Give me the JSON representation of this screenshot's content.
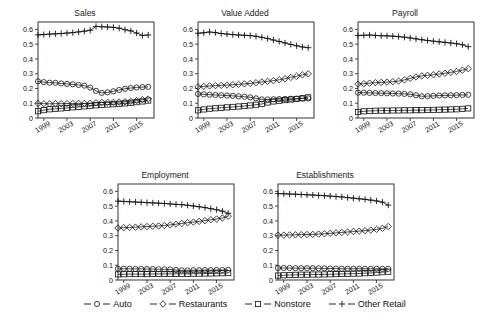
{
  "figure": {
    "width": 490,
    "height": 322,
    "background": "#ffffff",
    "axis_color": "#333333",
    "series_color": "#111111"
  },
  "legend": {
    "position": "bottom-center",
    "items": [
      {
        "label": "Auto",
        "marker": "circle-icon"
      },
      {
        "label": "Restaurants",
        "marker": "diamond-icon"
      },
      {
        "label": "Nonstore",
        "marker": "square-icon"
      },
      {
        "label": "Other Retail",
        "marker": "plus-icon"
      }
    ]
  },
  "chart_data": [
    {
      "type": "line",
      "title": "Sales",
      "xlabel": "",
      "ylabel": "",
      "xlim": [
        1998,
        2018
      ],
      "ylim": [
        0,
        0.65
      ],
      "yticks": [
        0,
        0.1,
        0.2,
        0.3,
        0.4,
        0.5,
        0.6
      ],
      "ytick_labels": [
        "0",
        "0.1",
        "0.2",
        "0.3",
        "0.4",
        "0.5",
        "0.6"
      ],
      "xticks": [
        1999,
        2003,
        2007,
        2011,
        2015
      ],
      "xtick_labels": [
        "1999",
        "2003",
        "2007",
        "2011",
        "2015"
      ],
      "grid": false,
      "x": [
        1998,
        1999,
        2000,
        2001,
        2002,
        2003,
        2004,
        2005,
        2006,
        2007,
        2008,
        2009,
        2010,
        2011,
        2012,
        2013,
        2014,
        2015,
        2016,
        2017
      ],
      "series": [
        {
          "name": "Auto",
          "marker": "circle",
          "values": [
            0.248,
            0.243,
            0.239,
            0.238,
            0.234,
            0.231,
            0.228,
            0.224,
            0.219,
            0.206,
            0.184,
            0.17,
            0.174,
            0.181,
            0.19,
            0.198,
            0.203,
            0.207,
            0.209,
            0.211
          ]
        },
        {
          "name": "Restaurants",
          "marker": "diamond",
          "values": [
            0.098,
            0.097,
            0.096,
            0.097,
            0.097,
            0.098,
            0.098,
            0.099,
            0.099,
            0.1,
            0.103,
            0.106,
            0.106,
            0.106,
            0.108,
            0.11,
            0.113,
            0.118,
            0.124,
            0.128
          ]
        },
        {
          "name": "Nonstore",
          "marker": "square",
          "values": [
            0.046,
            0.053,
            0.059,
            0.062,
            0.065,
            0.068,
            0.072,
            0.075,
            0.079,
            0.082,
            0.086,
            0.089,
            0.091,
            0.093,
            0.096,
            0.099,
            0.103,
            0.107,
            0.112,
            0.118
          ]
        },
        {
          "name": "Other Retail",
          "marker": "plus",
          "values": [
            0.563,
            0.565,
            0.568,
            0.57,
            0.572,
            0.575,
            0.578,
            0.583,
            0.588,
            0.594,
            0.62,
            0.618,
            0.616,
            0.614,
            0.608,
            0.598,
            0.59,
            0.575,
            0.559,
            0.562
          ]
        }
      ]
    },
    {
      "type": "line",
      "title": "Value Added",
      "xlabel": "",
      "ylabel": "",
      "xlim": [
        1998,
        2018
      ],
      "ylim": [
        0,
        0.65
      ],
      "yticks": [
        0,
        0.1,
        0.2,
        0.3,
        0.4,
        0.5,
        0.6
      ],
      "ytick_labels": [
        "0",
        "0.1",
        "0.2",
        "0.3",
        "0.4",
        "0.5",
        "0.6"
      ],
      "xticks": [
        1999,
        2003,
        2007,
        2011,
        2015
      ],
      "xtick_labels": [
        "1999",
        "2003",
        "2007",
        "2011",
        "2015"
      ],
      "grid": false,
      "x": [
        1998,
        1999,
        2000,
        2001,
        2002,
        2003,
        2004,
        2005,
        2006,
        2007,
        2008,
        2009,
        2010,
        2011,
        2012,
        2013,
        2014,
        2015,
        2016,
        2017
      ],
      "series": [
        {
          "name": "Auto",
          "marker": "circle",
          "values": [
            0.163,
            0.16,
            0.158,
            0.156,
            0.154,
            0.152,
            0.15,
            0.147,
            0.144,
            0.14,
            0.133,
            0.126,
            0.126,
            0.127,
            0.128,
            0.129,
            0.13,
            0.131,
            0.132,
            0.133
          ]
        },
        {
          "name": "Restaurants",
          "marker": "diamond",
          "values": [
            0.211,
            0.214,
            0.217,
            0.219,
            0.221,
            0.223,
            0.225,
            0.228,
            0.231,
            0.234,
            0.239,
            0.244,
            0.248,
            0.253,
            0.259,
            0.266,
            0.275,
            0.283,
            0.292,
            0.299
          ]
        },
        {
          "name": "Nonstore",
          "marker": "square",
          "values": [
            0.052,
            0.058,
            0.063,
            0.066,
            0.069,
            0.072,
            0.075,
            0.078,
            0.081,
            0.085,
            0.09,
            0.095,
            0.105,
            0.112,
            0.117,
            0.121,
            0.125,
            0.129,
            0.134,
            0.14
          ]
        },
        {
          "name": "Other Retail",
          "marker": "plus",
          "values": [
            0.574,
            0.577,
            0.582,
            0.578,
            0.572,
            0.568,
            0.565,
            0.562,
            0.56,
            0.558,
            0.553,
            0.546,
            0.538,
            0.528,
            0.518,
            0.508,
            0.498,
            0.489,
            0.481,
            0.476
          ]
        }
      ]
    },
    {
      "type": "line",
      "title": "Payroll",
      "xlabel": "",
      "ylabel": "",
      "xlim": [
        1998,
        2018
      ],
      "ylim": [
        0,
        0.65
      ],
      "yticks": [
        0,
        0.1,
        0.2,
        0.3,
        0.4,
        0.5,
        0.6
      ],
      "ytick_labels": [
        "0",
        "0.1",
        "0.2",
        "0.3",
        "0.4",
        "0.5",
        "0.6"
      ],
      "xticks": [
        1999,
        2003,
        2007,
        2011,
        2015
      ],
      "xtick_labels": [
        "1999",
        "2003",
        "2007",
        "2011",
        "2015"
      ],
      "grid": false,
      "x": [
        1998,
        1999,
        2000,
        2001,
        2002,
        2003,
        2004,
        2005,
        2006,
        2007,
        2008,
        2009,
        2010,
        2011,
        2012,
        2013,
        2014,
        2015,
        2016,
        2017
      ],
      "series": [
        {
          "name": "Auto",
          "marker": "circle",
          "values": [
            0.172,
            0.171,
            0.17,
            0.169,
            0.168,
            0.167,
            0.166,
            0.165,
            0.163,
            0.16,
            0.154,
            0.147,
            0.148,
            0.15,
            0.152,
            0.153,
            0.154,
            0.155,
            0.156,
            0.157
          ]
        },
        {
          "name": "Restaurants",
          "marker": "diamond",
          "values": [
            0.229,
            0.232,
            0.236,
            0.239,
            0.241,
            0.243,
            0.246,
            0.25,
            0.258,
            0.268,
            0.278,
            0.285,
            0.289,
            0.293,
            0.298,
            0.303,
            0.309,
            0.315,
            0.324,
            0.334
          ]
        },
        {
          "name": "Nonstore",
          "marker": "square",
          "values": [
            0.041,
            0.045,
            0.048,
            0.049,
            0.05,
            0.05,
            0.051,
            0.051,
            0.052,
            0.052,
            0.053,
            0.053,
            0.054,
            0.055,
            0.056,
            0.057,
            0.058,
            0.059,
            0.062,
            0.065
          ]
        },
        {
          "name": "Other Retail",
          "marker": "plus",
          "values": [
            0.559,
            0.56,
            0.562,
            0.559,
            0.557,
            0.556,
            0.554,
            0.551,
            0.547,
            0.542,
            0.536,
            0.53,
            0.525,
            0.52,
            0.516,
            0.512,
            0.508,
            0.503,
            0.496,
            0.483
          ]
        }
      ]
    },
    {
      "type": "line",
      "title": "Employment",
      "xlabel": "",
      "ylabel": "",
      "xlim": [
        1998,
        2018
      ],
      "ylim": [
        0,
        0.65
      ],
      "yticks": [
        0,
        0.1,
        0.2,
        0.3,
        0.4,
        0.5,
        0.6
      ],
      "ytick_labels": [
        "0",
        "0.1",
        "0.2",
        "0.3",
        "0.4",
        "0.5",
        "0.6"
      ],
      "xticks": [
        1999,
        2003,
        2007,
        2011,
        2015
      ],
      "xtick_labels": [
        "1999",
        "2003",
        "2007",
        "2011",
        "2015"
      ],
      "grid": false,
      "x": [
        1998,
        1999,
        2000,
        2001,
        2002,
        2003,
        2004,
        2005,
        2006,
        2007,
        2008,
        2009,
        2010,
        2011,
        2012,
        2013,
        2014,
        2015,
        2016,
        2017
      ],
      "series": [
        {
          "name": "Auto",
          "marker": "circle",
          "values": [
            0.076,
            0.076,
            0.076,
            0.075,
            0.075,
            0.074,
            0.074,
            0.073,
            0.072,
            0.071,
            0.068,
            0.065,
            0.065,
            0.066,
            0.066,
            0.067,
            0.067,
            0.068,
            0.068,
            0.069
          ]
        },
        {
          "name": "Restaurants",
          "marker": "diamond",
          "values": [
            0.352,
            0.354,
            0.356,
            0.358,
            0.36,
            0.362,
            0.364,
            0.366,
            0.369,
            0.373,
            0.378,
            0.383,
            0.388,
            0.392,
            0.397,
            0.402,
            0.408,
            0.413,
            0.42,
            0.432
          ]
        },
        {
          "name": "Nonstore",
          "marker": "square",
          "values": [
            0.038,
            0.039,
            0.04,
            0.04,
            0.04,
            0.04,
            0.041,
            0.041,
            0.041,
            0.041,
            0.042,
            0.042,
            0.042,
            0.043,
            0.043,
            0.044,
            0.044,
            0.045,
            0.046,
            0.047
          ]
        },
        {
          "name": "Other Retail",
          "marker": "plus",
          "values": [
            0.534,
            0.532,
            0.53,
            0.528,
            0.526,
            0.524,
            0.522,
            0.52,
            0.518,
            0.515,
            0.512,
            0.51,
            0.506,
            0.501,
            0.496,
            0.49,
            0.483,
            0.476,
            0.466,
            0.452
          ]
        }
      ]
    },
    {
      "type": "line",
      "title": "Establishments",
      "xlabel": "",
      "ylabel": "",
      "xlim": [
        1998,
        2018
      ],
      "ylim": [
        0,
        0.65
      ],
      "yticks": [
        0,
        0.1,
        0.2,
        0.3,
        0.4,
        0.5,
        0.6
      ],
      "ytick_labels": [
        "0",
        "0.1",
        "0.2",
        "0.3",
        "0.4",
        "0.5",
        "0.6"
      ],
      "xticks": [
        1999,
        2003,
        2007,
        2011,
        2015
      ],
      "xtick_labels": [
        "1999",
        "2003",
        "2007",
        "2011",
        "2015"
      ],
      "grid": false,
      "x": [
        1998,
        1999,
        2000,
        2001,
        2002,
        2003,
        2004,
        2005,
        2006,
        2007,
        2008,
        2009,
        2010,
        2011,
        2012,
        2013,
        2014,
        2015,
        2016,
        2017
      ],
      "series": [
        {
          "name": "Auto",
          "marker": "circle",
          "values": [
            0.081,
            0.081,
            0.081,
            0.08,
            0.08,
            0.08,
            0.08,
            0.079,
            0.079,
            0.078,
            0.077,
            0.076,
            0.076,
            0.076,
            0.076,
            0.076,
            0.076,
            0.076,
            0.076,
            0.076
          ]
        },
        {
          "name": "Restaurants",
          "marker": "diamond",
          "values": [
            0.304,
            0.304,
            0.305,
            0.306,
            0.307,
            0.308,
            0.309,
            0.311,
            0.313,
            0.316,
            0.319,
            0.322,
            0.325,
            0.328,
            0.331,
            0.334,
            0.338,
            0.343,
            0.35,
            0.362
          ]
        },
        {
          "name": "Nonstore",
          "marker": "square",
          "values": [
            0.03,
            0.032,
            0.034,
            0.035,
            0.036,
            0.036,
            0.037,
            0.037,
            0.038,
            0.039,
            0.04,
            0.041,
            0.042,
            0.043,
            0.044,
            0.046,
            0.048,
            0.05,
            0.053,
            0.056
          ]
        },
        {
          "name": "Other Retail",
          "marker": "plus",
          "values": [
            0.585,
            0.584,
            0.582,
            0.581,
            0.579,
            0.577,
            0.575,
            0.573,
            0.571,
            0.568,
            0.565,
            0.562,
            0.558,
            0.554,
            0.55,
            0.546,
            0.541,
            0.535,
            0.527,
            0.507
          ]
        }
      ]
    }
  ]
}
